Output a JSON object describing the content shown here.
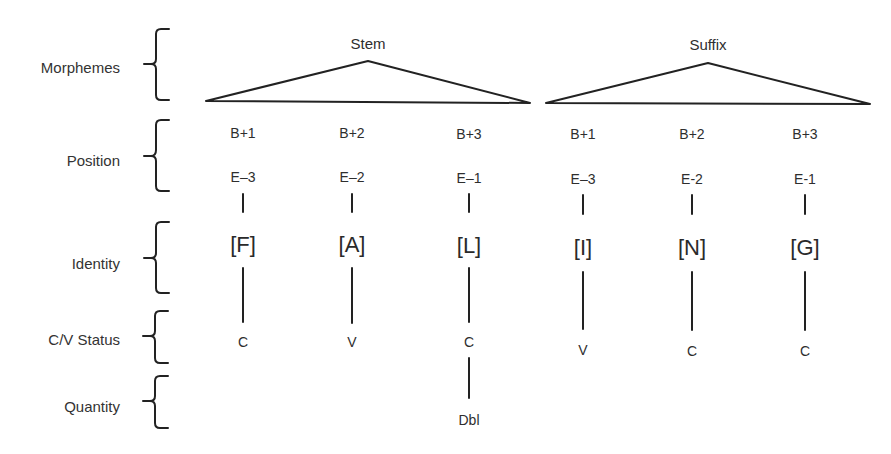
{
  "diagram": {
    "row_labels": [
      "Morphemes",
      "Position",
      "Identity",
      "C/V Status",
      "Quantity"
    ],
    "morphemes": [
      {
        "label": "Stem"
      },
      {
        "label": "Suffix"
      }
    ],
    "columns": [
      {
        "morpheme": "Stem",
        "begin_pos": "B+1",
        "end_pos": "E–3",
        "identity": "[F]",
        "cv": "C",
        "quantity": ""
      },
      {
        "morpheme": "Stem",
        "begin_pos": "B+2",
        "end_pos": "E–2",
        "identity": "[A]",
        "cv": "V",
        "quantity": ""
      },
      {
        "morpheme": "Stem",
        "begin_pos": "B+3",
        "end_pos": "E–1",
        "identity": "[L]",
        "cv": "C",
        "quantity": "Dbl"
      },
      {
        "morpheme": "Suffix",
        "begin_pos": "B+1",
        "end_pos": "E–3",
        "identity": "[I]",
        "cv": "V",
        "quantity": ""
      },
      {
        "morpheme": "Suffix",
        "begin_pos": "B+2",
        "end_pos": "E-2",
        "identity": "[N]",
        "cv": "C",
        "quantity": ""
      },
      {
        "morpheme": "Suffix",
        "begin_pos": "B+3",
        "end_pos": "E-1",
        "identity": "[G]",
        "cv": "C",
        "quantity": ""
      }
    ],
    "line_color": "#222222",
    "text_color": "#2e2e2e"
  }
}
